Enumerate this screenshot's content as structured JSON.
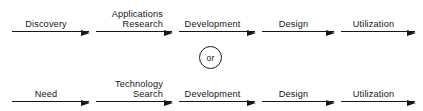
{
  "diagram": {
    "type": "process-flow",
    "title": "",
    "connector": {
      "label": "or",
      "shape": "circle"
    },
    "colors": {
      "line": "#15171a",
      "text": "#15171a",
      "background": "#ffffff"
    },
    "flows": [
      {
        "name": "technology-push-flow",
        "steps": [
          {
            "label": "Discovery",
            "align": "center"
          },
          {
            "label": "Applications\nResearch",
            "align": "right"
          },
          {
            "label": "Development",
            "align": "center"
          },
          {
            "label": "Design",
            "align": "center"
          },
          {
            "label": "Utilization",
            "align": "center"
          }
        ]
      },
      {
        "name": "need-pull-flow",
        "steps": [
          {
            "label": "Need",
            "align": "center"
          },
          {
            "label": "Technology\nSearch",
            "align": "right"
          },
          {
            "label": "Development",
            "align": "center"
          },
          {
            "label": "Design",
            "align": "center"
          },
          {
            "label": "Utilization",
            "align": "center"
          }
        ]
      }
    ],
    "geometry": {
      "segments": [
        {
          "left": 12,
          "width": 77
        },
        {
          "left": 96,
          "width": 76
        },
        {
          "left": 179,
          "width": 76
        },
        {
          "left": 262,
          "width": 72
        },
        {
          "left": 341,
          "width": 74
        }
      ]
    }
  }
}
